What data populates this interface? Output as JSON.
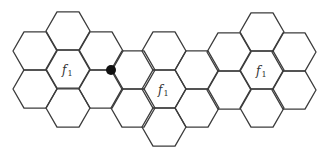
{
  "diagram": {
    "type": "hexagonal-cell-grid",
    "hex_side": 22,
    "stroke_color": "#3c3c3c",
    "background": "#ffffff",
    "cells": [
      {
        "cx": 35,
        "cy": 51
      },
      {
        "cx": 35,
        "cy": 89
      },
      {
        "cx": 68,
        "cy": 31
      },
      {
        "cx": 68,
        "cy": 69
      },
      {
        "cx": 68,
        "cy": 108
      },
      {
        "cx": 101,
        "cy": 51
      },
      {
        "cx": 101,
        "cy": 89
      },
      {
        "cx": 133,
        "cy": 70
      },
      {
        "cx": 133,
        "cy": 108
      },
      {
        "cx": 164,
        "cy": 51
      },
      {
        "cx": 164,
        "cy": 89
      },
      {
        "cx": 164,
        "cy": 127
      },
      {
        "cx": 197,
        "cy": 70
      },
      {
        "cx": 197,
        "cy": 108
      },
      {
        "cx": 229,
        "cy": 52
      },
      {
        "cx": 229,
        "cy": 90
      },
      {
        "cx": 262,
        "cy": 32
      },
      {
        "cx": 262,
        "cy": 70
      },
      {
        "cx": 262,
        "cy": 108
      },
      {
        "cx": 294,
        "cy": 52
      },
      {
        "cx": 294,
        "cy": 90
      }
    ],
    "labels": [
      {
        "text": "f",
        "sub": "1",
        "x": 62,
        "y": 74
      },
      {
        "text": "f",
        "sub": "1",
        "x": 158,
        "y": 94
      },
      {
        "text": "f",
        "sub": "1",
        "x": 256,
        "y": 75
      }
    ],
    "marker": {
      "x": 111,
      "y": 70,
      "r": 5,
      "color": "#111111"
    }
  }
}
